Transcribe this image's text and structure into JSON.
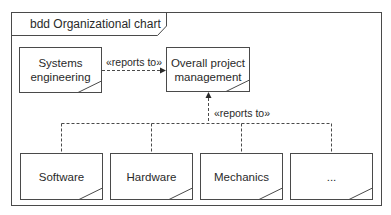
{
  "frame": {
    "title": "bdd Organizational chart"
  },
  "blocks": {
    "systems_engineering": {
      "label_line1": "Systems",
      "label_line2": "engineering"
    },
    "overall_pm": {
      "label_line1": "Overall project",
      "label_line2": "management"
    },
    "software": {
      "label": "Software"
    },
    "hardware": {
      "label": "Hardware"
    },
    "mechanics": {
      "label": "Mechanics"
    },
    "more": {
      "label": "..."
    }
  },
  "relations": {
    "horizontal": {
      "stereotype": "«reports to»"
    },
    "vertical": {
      "stereotype": "«reports to»"
    }
  },
  "colors": {
    "stroke": "#4a4a4a",
    "text": "#2a2a2a",
    "background": "#ffffff"
  }
}
